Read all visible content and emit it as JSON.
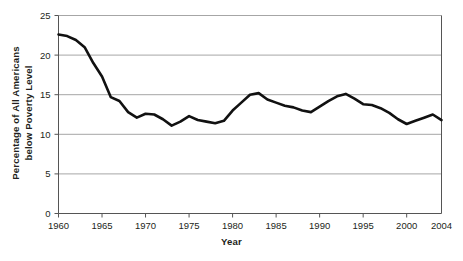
{
  "chart_data": {
    "type": "line",
    "title": "",
    "xlabel": "Year",
    "ylabel_line1": "Percentage of All Americans",
    "ylabel_line2": "below Poverty Level",
    "ylabel": "Percentage of All Americans below Poverty Level",
    "xlim": [
      1960,
      2004
    ],
    "ylim": [
      0,
      25
    ],
    "xticks": [
      1960,
      1965,
      1970,
      1975,
      1980,
      1985,
      1990,
      1995,
      2000,
      2004
    ],
    "xtick_labels": [
      "1960",
      "1965",
      "1970",
      "1975",
      "1980",
      "1985",
      "1990",
      "1995",
      "2000",
      "2004"
    ],
    "yticks": [
      0,
      5,
      10,
      15,
      20,
      25
    ],
    "ytick_labels": [
      "0",
      "5",
      "10",
      "15",
      "20",
      "25"
    ],
    "grid": "horizontal",
    "legend": "none",
    "line_color": "#111111",
    "grid_color": "#a6a6a6",
    "axis_color": "#555555",
    "background_color": "#ffffff",
    "x": [
      1960,
      1961,
      1962,
      1963,
      1964,
      1965,
      1966,
      1967,
      1968,
      1969,
      1970,
      1971,
      1972,
      1973,
      1974,
      1975,
      1976,
      1977,
      1978,
      1979,
      1980,
      1981,
      1982,
      1983,
      1984,
      1985,
      1986,
      1987,
      1988,
      1989,
      1990,
      1991,
      1992,
      1993,
      1994,
      1995,
      1996,
      1997,
      1998,
      1999,
      2000,
      2001,
      2002,
      2003,
      2004
    ],
    "values": [
      22.6,
      22.4,
      21.9,
      21.0,
      19.0,
      17.3,
      14.7,
      14.2,
      12.8,
      12.1,
      12.6,
      12.5,
      11.9,
      11.1,
      11.6,
      12.3,
      11.8,
      11.6,
      11.4,
      11.7,
      13.0,
      14.0,
      15.0,
      15.2,
      14.4,
      14.0,
      13.6,
      13.4,
      13.0,
      12.8,
      13.5,
      14.2,
      14.8,
      15.1,
      14.5,
      13.8,
      13.7,
      13.3,
      12.7,
      11.9,
      11.3,
      11.7,
      12.1,
      12.5,
      11.8
    ]
  }
}
